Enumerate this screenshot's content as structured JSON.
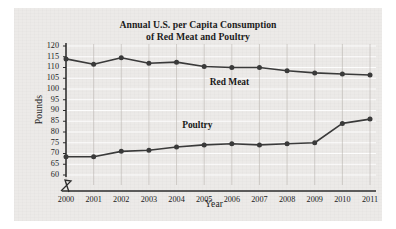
{
  "figure": {
    "background_color": "#eceae8",
    "ink_color": "#1b1b1b"
  },
  "chart_data": {
    "type": "line",
    "title": "Annual U.S. per Capita Consumption of Red Meat and Poultry",
    "title_line_1": "Annual U.S. per Capita Consumption",
    "title_line_2": "of Red Meat and Poultry",
    "xlabel": "Year",
    "ylabel": "Pounds",
    "grid": true,
    "legend_position": "inline-labels",
    "axis_break_y": true,
    "categories": [
      "2000",
      "2001",
      "2002",
      "2003",
      "2004",
      "2005",
      "2006",
      "2007",
      "2008",
      "2009",
      "2010",
      "2011"
    ],
    "x": [
      2000,
      2001,
      2002,
      2003,
      2004,
      2005,
      2006,
      2007,
      2008,
      2009,
      2010,
      2011
    ],
    "xlim": [
      2000,
      2011
    ],
    "ylim": [
      60,
      120
    ],
    "yticks": [
      60,
      65,
      70,
      75,
      80,
      85,
      90,
      95,
      100,
      105,
      110,
      115,
      120
    ],
    "ytick_labels": [
      "60",
      "65",
      "70",
      "75",
      "80",
      "85",
      "90",
      "95",
      "100",
      "105",
      "110",
      "115",
      "120"
    ],
    "xtick_labels": [
      "2000",
      "2001",
      "2002",
      "2003",
      "2004",
      "2005",
      "2006",
      "2007",
      "2008",
      "2009",
      "2010",
      "2011"
    ],
    "series": [
      {
        "name": "Red Meat",
        "label": "Red Meat",
        "color": "#3a3a3a",
        "values": [
          114,
          111.5,
          114.5,
          112,
          112.5,
          110.5,
          110,
          110,
          108.5,
          107.5,
          107,
          106.5
        ]
      },
      {
        "name": "Poultry",
        "label": "Poultry",
        "color": "#3a3a3a",
        "values": [
          68.5,
          68.5,
          71,
          71.5,
          73,
          74,
          74.5,
          74,
          74.5,
          75,
          84,
          86
        ]
      }
    ]
  }
}
